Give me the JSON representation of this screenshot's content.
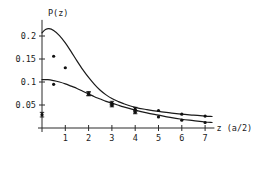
{
  "chart_data": {
    "type": "line",
    "title": "",
    "subtitle": "",
    "xlabel": "z (a/2)",
    "ylabel": "P(z)",
    "xlim": [
      0,
      7.4
    ],
    "ylim": [
      0,
      0.235
    ],
    "grid": false,
    "legend": "none",
    "x_ticks": [
      1,
      2,
      3,
      4,
      5,
      6,
      7
    ],
    "x_tick_labels": [
      "1",
      "2",
      "3",
      "4",
      "5",
      "6",
      "7"
    ],
    "y_ticks": [
      0.05,
      0.1,
      0.15,
      0.2
    ],
    "y_tick_labels": [
      "0.05",
      "0.1",
      "0.15",
      "0.2"
    ],
    "series": [
      {
        "name": "upper curve",
        "kind": "line",
        "x": [
          0.0,
          0.15,
          0.3,
          0.5,
          0.75,
          1.0,
          1.25,
          1.5,
          1.75,
          2.0,
          2.25,
          2.5,
          2.75,
          3.0,
          3.25,
          3.5,
          4.0,
          4.5,
          5.0,
          5.5,
          6.0,
          6.5,
          7.0,
          7.3
        ],
        "y": [
          0.207,
          0.214,
          0.216,
          0.212,
          0.201,
          0.185,
          0.166,
          0.146,
          0.127,
          0.11,
          0.095,
          0.082,
          0.072,
          0.064,
          0.058,
          0.053,
          0.045,
          0.04,
          0.036,
          0.033,
          0.03,
          0.028,
          0.026,
          0.025
        ]
      },
      {
        "name": "lower curve",
        "kind": "line",
        "x": [
          0.0,
          0.25,
          0.5,
          0.75,
          1.0,
          1.25,
          1.5,
          1.75,
          2.0,
          2.25,
          2.5,
          2.75,
          3.0,
          3.25,
          3.5,
          4.0,
          4.5,
          5.0,
          5.5,
          6.0,
          6.5,
          7.0,
          7.3
        ],
        "y": [
          0.105,
          0.105,
          0.103,
          0.1,
          0.096,
          0.091,
          0.086,
          0.08,
          0.074,
          0.068,
          0.063,
          0.058,
          0.054,
          0.05,
          0.046,
          0.039,
          0.033,
          0.028,
          0.023,
          0.019,
          0.016,
          0.013,
          0.012
        ]
      },
      {
        "name": "upper data points",
        "kind": "scatter",
        "x": [
          0.5,
          1.0,
          2.0,
          3.0,
          4.0,
          5.0,
          6.0,
          7.0
        ],
        "y": [
          0.156,
          0.131,
          0.075,
          0.054,
          0.041,
          0.038,
          0.03,
          0.026
        ],
        "yerr": [
          0.0,
          0.0,
          0.004,
          0.004,
          0.004,
          0.0,
          0.0,
          0.0
        ]
      },
      {
        "name": "lower data points",
        "kind": "scatter",
        "x": [
          0.0,
          0.5,
          2.0,
          3.0,
          4.0,
          5.0,
          6.0,
          7.0
        ],
        "y": [
          0.029,
          0.095,
          0.074,
          0.049,
          0.034,
          0.024,
          0.017,
          0.012
        ],
        "yerr": [
          0.005,
          0.0,
          0.004,
          0.003,
          0.003,
          0.0,
          0.0,
          0.0
        ]
      }
    ],
    "colors": {
      "curve": "#1a1a1a",
      "points": "#111111",
      "axis": "#2a2a2a",
      "background": "#ffffff"
    }
  }
}
